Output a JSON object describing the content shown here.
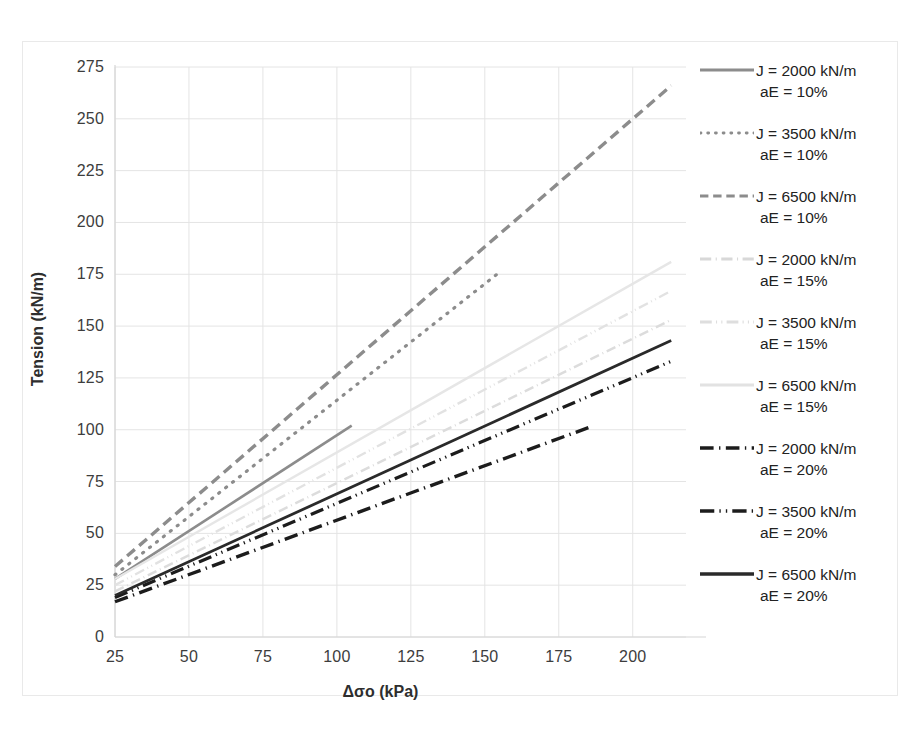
{
  "chart_data": {
    "type": "line",
    "title": "",
    "xlabel": "Δσo (kPa)",
    "ylabel": "Tension (kN/m)",
    "xlim": [
      25,
      218
    ],
    "ylim": [
      0,
      275
    ],
    "xticks": [
      25,
      50,
      75,
      100,
      125,
      150,
      175,
      200
    ],
    "yticks": [
      0,
      25,
      50,
      75,
      100,
      125,
      150,
      175,
      200,
      225,
      250,
      275
    ],
    "grid": true,
    "legend_position": "right",
    "series": [
      {
        "name": "J = 2000 kN/m\naE = 10%",
        "label_line1": "J = 2000 kN/m",
        "label_line2": "aE = 10%",
        "style": "solid",
        "color": "#8c8c8c",
        "width": 2.6,
        "x": [
          25,
          105
        ],
        "y": [
          28,
          102
        ]
      },
      {
        "name": "J = 3500 kN/m\naE = 10%",
        "label_line1": "J = 3500 kN/m",
        "label_line2": "aE = 10%",
        "style": "dotted",
        "color": "#8c8c8c",
        "width": 3.2,
        "x": [
          25,
          155
        ],
        "y": [
          30,
          176
        ]
      },
      {
        "name": "J = 6500 kN/m\naE = 10%",
        "label_line1": "J = 6500 kN/m",
        "label_line2": "aE = 10%",
        "style": "dashed",
        "color": "#8c8c8c",
        "width": 3.4,
        "x": [
          25,
          213
        ],
        "y": [
          34,
          266
        ]
      },
      {
        "name": "J = 2000 kN/m\naE = 15%",
        "label_line1": "J = 2000 kN/m",
        "label_line2": "aE = 15%",
        "style": "dashdot",
        "color": "#dcdcdc",
        "width": 2.4,
        "x": [
          25,
          213
        ],
        "y": [
          22,
          153
        ]
      },
      {
        "name": "J = 3500 kN/m\naE = 15%",
        "label_line1": "J = 3500 kN/m",
        "label_line2": "aE = 15%",
        "style": "dashdotdot",
        "color": "#e2e2e2",
        "width": 2.4,
        "x": [
          25,
          213
        ],
        "y": [
          25,
          167
        ]
      },
      {
        "name": "J = 6500 kN/m\naE = 15%",
        "label_line1": "J = 6500 kN/m",
        "label_line2": "aE = 15%",
        "style": "solid-light",
        "color": "#e6e6e6",
        "width": 2.4,
        "x": [
          25,
          213
        ],
        "y": [
          28,
          181
        ]
      },
      {
        "name": "J = 2000 kN/m\naE = 20%",
        "label_line1": "J = 2000 kN/m",
        "label_line2": "aE = 20%",
        "style": "dashdot-dark",
        "color": "#1c1c1c",
        "width": 3.4,
        "x": [
          25,
          185
        ],
        "y": [
          17,
          101
        ]
      },
      {
        "name": "J = 3500 kN/m\naE = 20%",
        "label_line1": "J = 3500 kN/m",
        "label_line2": "aE = 20%",
        "style": "dashdotdot-dark",
        "color": "#1c1c1c",
        "width": 3.2,
        "x": [
          25,
          213
        ],
        "y": [
          19,
          133
        ]
      },
      {
        "name": "J = 6500 kN/m\naE = 20%",
        "label_line1": "J = 6500 kN/m",
        "label_line2": "aE = 20%",
        "style": "solid-dark",
        "color": "#2a2a2a",
        "width": 2.8,
        "x": [
          25,
          213
        ],
        "y": [
          20,
          143
        ]
      }
    ]
  },
  "axes": {
    "x_label": "Δσo (kPa)",
    "y_label": "Tension (kN/m)",
    "x_ticks": [
      "25",
      "50",
      "75",
      "100",
      "125",
      "150",
      "175",
      "200"
    ],
    "y_ticks": [
      "275",
      "250",
      "225",
      "200",
      "175",
      "150",
      "125",
      "100",
      "75",
      "50",
      "25",
      "0"
    ]
  },
  "legend": {
    "items": [
      {
        "line1": "J = 2000 kN/m",
        "line2": "aE = 10%",
        "style": "solid",
        "color": "#8c8c8c"
      },
      {
        "line1": "J = 3500 kN/m",
        "line2": "aE = 10%",
        "style": "dotted",
        "color": "#8c8c8c"
      },
      {
        "line1": "J = 6500 kN/m",
        "line2": "aE = 10%",
        "style": "dashed",
        "color": "#8c8c8c"
      },
      {
        "line1": "J = 2000 kN/m",
        "line2": "aE = 15%",
        "style": "dashdot",
        "color": "#d8d8d8"
      },
      {
        "line1": "J = 3500 kN/m",
        "line2": "aE = 15%",
        "style": "dashdotdot",
        "color": "#dedede"
      },
      {
        "line1": "J = 6500 kN/m",
        "line2": "aE = 15%",
        "style": "solid-light",
        "color": "#e2e2e2"
      },
      {
        "line1": "J = 2000 kN/m",
        "line2": "aE = 20%",
        "style": "dashdot-dark",
        "color": "#1c1c1c"
      },
      {
        "line1": "J = 3500 kN/m",
        "line2": "aE = 20%",
        "style": "dashdotdot-dark",
        "color": "#1c1c1c"
      },
      {
        "line1": "J = 6500 kN/m",
        "line2": "aE = 20%",
        "style": "solid-dark",
        "color": "#2a2a2a"
      }
    ]
  },
  "colors": {
    "grid": "#e4e4e4",
    "frame": "#e9e9e9",
    "text": "#3a3a3a",
    "background": "#ffffff"
  }
}
